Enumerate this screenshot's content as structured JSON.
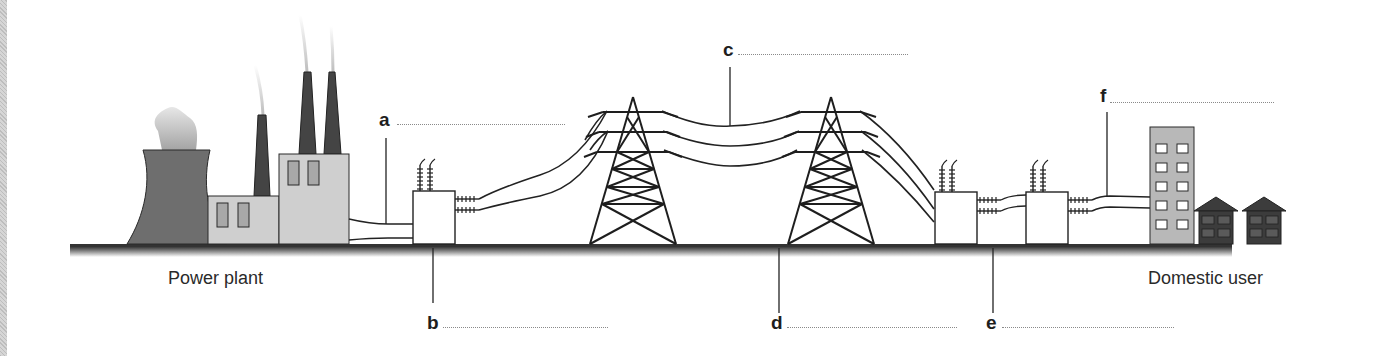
{
  "diagram": {
    "captions": {
      "source": "Power plant",
      "destination": "Domestic user"
    },
    "labels": [
      {
        "id": "a",
        "letter": "a",
        "points_to": "underground cable from power plant to step-up transformer"
      },
      {
        "id": "b",
        "letter": "b",
        "points_to": "step-up transformer"
      },
      {
        "id": "c",
        "letter": "c",
        "points_to": "overhead high-voltage transmission lines"
      },
      {
        "id": "d",
        "letter": "d",
        "points_to": "pylon / transmission tower"
      },
      {
        "id": "e",
        "letter": "e",
        "points_to": "step-down transformers (substation)"
      },
      {
        "id": "f",
        "letter": "f",
        "points_to": "distribution cable to consumers"
      }
    ],
    "colors": {
      "ground": "#4a4a4a",
      "cooling_tower": "#6e6e6e",
      "buildings": "#cfcfcf",
      "chimneys": "#444444",
      "houses": "#3c3c3c",
      "lines": "#222222",
      "blank_line": "#8a8a8a"
    }
  }
}
